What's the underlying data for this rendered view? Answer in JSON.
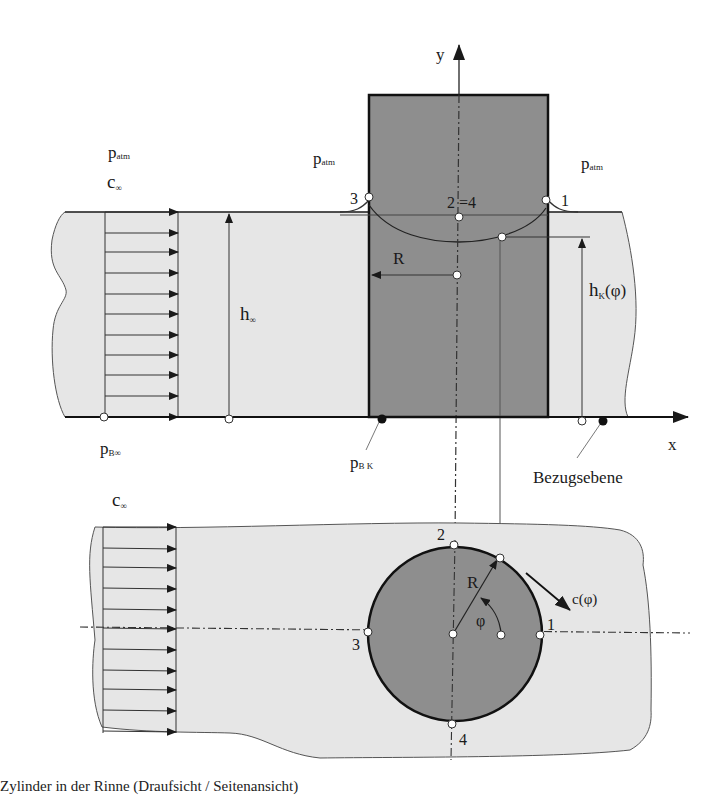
{
  "colors": {
    "water": "#e6e6e6",
    "cylinder": "#8e8e8e",
    "line": "#1a1a1a",
    "background": "#ffffff"
  },
  "top_view": {
    "axis_y_label": "y",
    "axis_x_label": "x",
    "p_atm_left": {
      "base": "p",
      "sub": "atm"
    },
    "c_inf_top": {
      "base": "c",
      "sub": "∞"
    },
    "p_atm_mid": {
      "base": "p",
      "sub": "atm"
    },
    "p_atm_right": {
      "base": "p",
      "sub": "atm"
    },
    "point_3": "3",
    "point_1": "1",
    "point_2_4": "2 =4",
    "radius_label": "R",
    "h_inf": {
      "base": "h",
      "sub": "∞"
    },
    "h_k_phi": {
      "base": "h",
      "sub": "K",
      "suffix": "(φ)"
    },
    "p_b_inf": {
      "base": "p",
      "sub": "B∞"
    },
    "p_bk": {
      "base": "p",
      "sub": "B K"
    },
    "reference_plane": "Bezugsebene"
  },
  "bottom_view": {
    "c_inf": {
      "base": "c",
      "sub": "∞"
    },
    "point_1": "1",
    "point_2": "2",
    "point_3": "3",
    "point_4": "4",
    "radius_label": "R",
    "angle_label": "φ",
    "velocity_label": "c(φ)"
  },
  "caption": "Zylinder in der Rinne (Draufsicht / Seitenansicht)"
}
